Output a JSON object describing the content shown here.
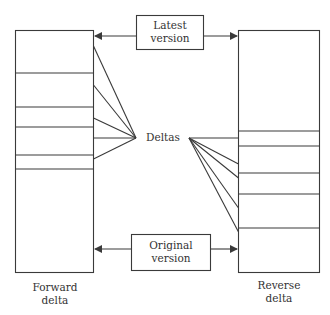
{
  "diagram": {
    "colors": {
      "line": "#3a3a3a",
      "text": "#333333",
      "background": "#ffffff"
    },
    "latest_version": {
      "line1": "Latest",
      "line2": "version"
    },
    "original_version": {
      "line1": "Original",
      "line2": "version"
    },
    "deltas_label": "Deltas",
    "forward_delta": {
      "line1": "Forward",
      "line2": "delta"
    },
    "reverse_delta": {
      "line1": "Reverse",
      "line2": "delta"
    }
  }
}
